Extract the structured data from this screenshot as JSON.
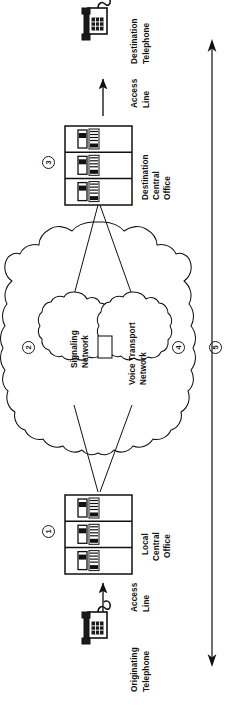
{
  "figure": {
    "orientation": "rotated-90-ccw",
    "stroke_color": "#111111",
    "background_color": "#ffffff"
  },
  "nodes": {
    "originating_telephone": {
      "label_line1": "Originating",
      "label_line2": "Telephone",
      "icon": "desk-telephone-icon"
    },
    "destination_telephone": {
      "label_line1": "Destination",
      "label_line2": "Telephone",
      "icon": "desk-telephone-icon"
    },
    "local_central_office": {
      "label_line1": "Local",
      "label_line2": "Central",
      "label_line3": "Office",
      "icon": "switch-rack-icon",
      "marker": "1"
    },
    "destination_central_office": {
      "label_line1": "Destination",
      "label_line2": "Central",
      "label_line3": "Office",
      "icon": "switch-rack-icon",
      "marker": "3"
    },
    "signaling_network": {
      "label_line1": "Signaling",
      "label_line2": "Network",
      "icon": "cloud-icon"
    },
    "voice_transport_network": {
      "label_line1": "Voice Transport",
      "label_line2": "Network",
      "icon": "cloud-icon",
      "marker": "4"
    },
    "outer_network_cloud": {
      "icon": "cloud-icon",
      "marker": "2"
    }
  },
  "links": {
    "originating_access_line": {
      "label_line1": "Access",
      "label_line2": "Line",
      "icon": "arrow-up-icon"
    },
    "destination_access_line": {
      "label_line1": "Access",
      "label_line2": "Line",
      "icon": "arrow-up-icon"
    },
    "end_to_end_span": {
      "marker": "5",
      "icon": "double-headed-arrow-icon"
    }
  },
  "markers": {
    "one": "1",
    "two": "2",
    "three": "3",
    "four": "4",
    "five": "5"
  }
}
